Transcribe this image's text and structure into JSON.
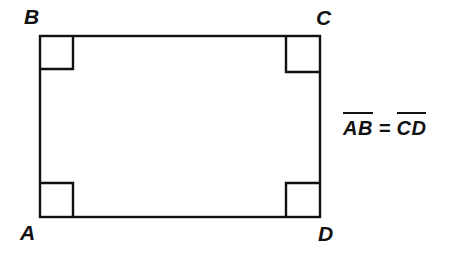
{
  "figure": {
    "type": "geometry-diagram",
    "shape": "rectangle",
    "background_color": "#ffffff",
    "ink_color": "#111111",
    "stroke_width": 2,
    "rectangle": {
      "left": 40,
      "top": 36,
      "right": 320,
      "bottom": 217,
      "width": 280,
      "height": 181
    },
    "right_angle_marker": {
      "size": 33,
      "count": 4,
      "corners": [
        "top-left",
        "top-right",
        "bottom-left",
        "bottom-right"
      ]
    },
    "vertices": [
      {
        "id": "B",
        "label": "B",
        "position": "top-left"
      },
      {
        "id": "C",
        "label": "C",
        "position": "top-right"
      },
      {
        "id": "A",
        "label": "A",
        "position": "bottom-left"
      },
      {
        "id": "D",
        "label": "D",
        "position": "bottom-right"
      }
    ],
    "annotation": {
      "segment_left": "AB",
      "relation": "=",
      "segment_right": "CD",
      "full_text": "AB = CD"
    }
  }
}
